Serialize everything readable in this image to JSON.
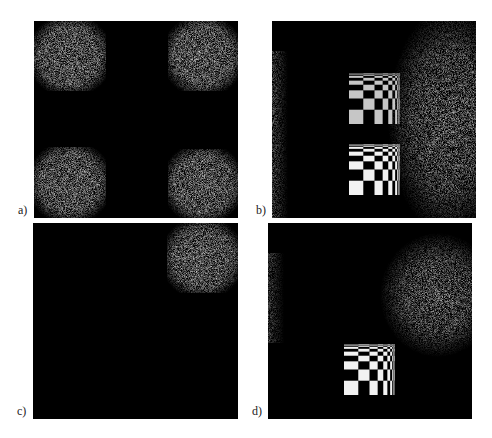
{
  "figure": {
    "panels": [
      {
        "id": "a",
        "label": "a)",
        "description": "Four noisy bright squares at the corners on black background"
      },
      {
        "id": "b",
        "label": "b)",
        "description": "Two chirp checkerboards with bright noisy region on right and faint strip on left"
      },
      {
        "id": "c",
        "label": "c)",
        "description": "Single noisy bright square in top-right corner"
      },
      {
        "id": "d",
        "label": "d)",
        "description": "One chirp checkerboard with bright noisy blob upper-right and faint strip on left"
      }
    ]
  },
  "colors": {
    "background": "#ffffff",
    "panel": "#000000",
    "noise_bright": "#c8c8c8",
    "checker_white": "#f2f2f2"
  },
  "checker": {
    "bands": [
      0,
      0.28,
      0.5,
      0.66,
      0.77,
      0.85,
      0.905,
      0.945,
      0.97,
      0.988,
      1.0
    ]
  }
}
